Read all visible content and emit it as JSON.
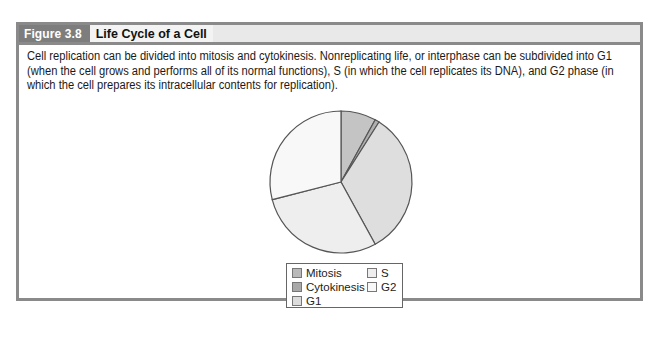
{
  "figure": {
    "number": "Figure 3.8",
    "title": "Life Cycle of a Cell",
    "caption": "Cell replication can be divided into mitosis and cytokinesis. Nonreplicating life, or interphase can be subdivided into G1 (when the cell grows and performs all of its normal functions), S (in which the cell replicates its DNA), and G2 phase (in which the cell prepares its intracellular contents for replication)."
  },
  "colors": {
    "frame": "#8a8a8a",
    "header_number_bg": "#7d7d7d",
    "header_bg": "#e9e9e9"
  },
  "chart_data": {
    "type": "pie",
    "title": "",
    "categories": [
      "Mitosis",
      "Cytokinesis",
      "G1",
      "S",
      "G2"
    ],
    "values": [
      8,
      1,
      33,
      29,
      29
    ],
    "colors": [
      "#c4c4c4",
      "#b0b0b0",
      "#dedede",
      "#eeeeee",
      "#f8f8f8"
    ],
    "start_angle_deg": 0,
    "direction": "clockwise",
    "legend": {
      "position": "bottom",
      "entries": [
        "Mitosis",
        "Cytokinesis",
        "G1",
        "S",
        "G2"
      ]
    }
  }
}
